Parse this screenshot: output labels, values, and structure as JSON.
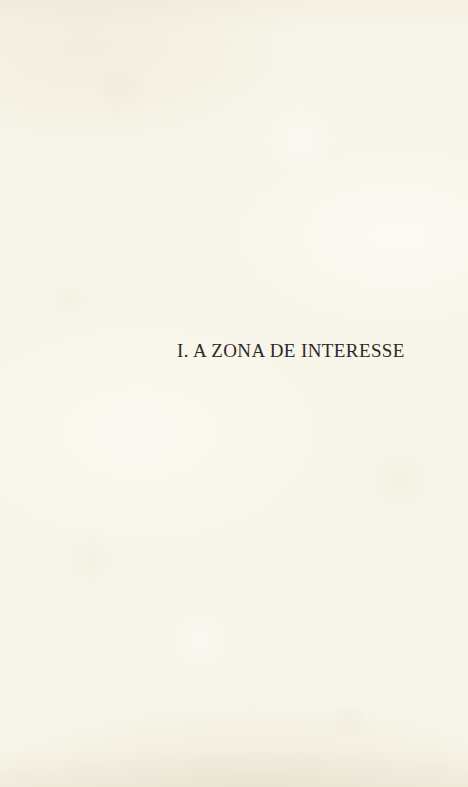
{
  "page": {
    "kind": "book-part-title-page",
    "section_title": "I. A ZONA DE INTERESSE"
  },
  "colors": {
    "paper_background": "#f8f5ea",
    "paper_edge_shade": "#eee9d9",
    "text_ink": "#2e2a24"
  }
}
